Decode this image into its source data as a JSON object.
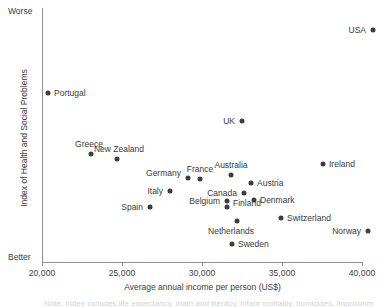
{
  "chart_data": {
    "type": "scatter",
    "title": "",
    "xlabel": "Average annual income per person (US$)",
    "ylabel": "Index of Health and Social Problems",
    "xlim": [
      20000,
      40062
    ],
    "xticks": [
      20000,
      25000,
      30000,
      35000,
      40000
    ],
    "xticklabels": [
      "20,000",
      "25,000",
      "30,000",
      "35,000",
      "40,000"
    ],
    "ylim_labels": {
      "top": "Worse",
      "bottom": "Better"
    },
    "grid": false,
    "legend": "none",
    "point_color": "#3d3d3d",
    "axis_color": "#8f8f8f",
    "points": [
      {
        "name": "USA",
        "x": 40690,
        "y_px": 30,
        "x_px": 373,
        "label_side": "r",
        "label_dx": -7,
        "label_dy": 0
      },
      {
        "name": "Portugal",
        "x": 20375,
        "y_px": 93,
        "x_px": 48,
        "label_side": "l",
        "label_dx": 6,
        "label_dy": 0
      },
      {
        "name": "UK",
        "x": 32500,
        "y_px": 121,
        "x_px": 242,
        "label_side": "r",
        "label_dx": -7,
        "label_dy": 0
      },
      {
        "name": "Greece",
        "x": 23060,
        "y_px": 154,
        "x_px": 91,
        "label_side": "c",
        "label_dx": -2,
        "label_dy": -10
      },
      {
        "name": "New Zealand",
        "x": 24690,
        "y_px": 159,
        "x_px": 117,
        "label_side": "c",
        "label_dx": 2,
        "label_dy": -10
      },
      {
        "name": "Ireland",
        "x": 37560,
        "y_px": 164,
        "x_px": 323,
        "label_side": "l",
        "label_dx": 6,
        "label_dy": 0
      },
      {
        "name": "Australia",
        "x": 31810,
        "y_px": 175,
        "x_px": 231,
        "label_side": "c",
        "label_dx": 0,
        "label_dy": -10
      },
      {
        "name": "France",
        "x": 29875,
        "y_px": 179,
        "x_px": 200,
        "label_side": "c",
        "label_dx": 0,
        "label_dy": -10
      },
      {
        "name": "Germany",
        "x": 29125,
        "y_px": 178,
        "x_px": 188,
        "label_side": "r",
        "label_dx": -7,
        "label_dy": -5
      },
      {
        "name": "Austria",
        "x": 33060,
        "y_px": 183,
        "x_px": 251,
        "label_side": "l",
        "label_dx": 6,
        "label_dy": 0
      },
      {
        "name": "Italy",
        "x": 28000,
        "y_px": 191,
        "x_px": 170,
        "label_side": "r",
        "label_dx": -7,
        "label_dy": 0
      },
      {
        "name": "Canada",
        "x": 32625,
        "y_px": 193,
        "x_px": 244,
        "label_side": "r",
        "label_dx": -7,
        "label_dy": 0
      },
      {
        "name": "Denmark",
        "x": 33250,
        "y_px": 200,
        "x_px": 254,
        "label_side": "l",
        "label_dx": 6,
        "label_dy": 0
      },
      {
        "name": "Belgium",
        "x": 31560,
        "y_px": 201,
        "x_px": 227,
        "label_side": "r",
        "label_dx": -7,
        "label_dy": 0
      },
      {
        "name": "Spain",
        "x": 26750,
        "y_px": 207,
        "x_px": 150,
        "label_side": "r",
        "label_dx": -7,
        "label_dy": 0
      },
      {
        "name": "Finland",
        "x": 31560,
        "y_px": 207,
        "x_px": 227,
        "label_side": "l",
        "label_dx": 6,
        "label_dy": -4
      },
      {
        "name": "Switzerland",
        "x": 35000,
        "y_px": 218,
        "x_px": 281,
        "label_side": "l",
        "label_dx": 6,
        "label_dy": 0
      },
      {
        "name": "Netherlands",
        "x": 32190,
        "y_px": 221,
        "x_px": 237,
        "label_side": "c",
        "label_dx": -6,
        "label_dy": 10
      },
      {
        "name": "Norway",
        "x": 41190,
        "y_px": 231,
        "x_px": 368,
        "label_side": "r",
        "label_dx": -7,
        "label_dy": 0
      },
      {
        "name": "Sweden",
        "x": 31875,
        "y_px": 244,
        "x_px": 232,
        "label_side": "l",
        "label_dx": 6,
        "label_dy": 0
      }
    ]
  },
  "axis": {
    "x_title": "Average annual income per person (US$)",
    "y_title": "Index of Health and Social Problems",
    "worse_label": "Worse",
    "better_label": "Better"
  },
  "caption_cut": "Note: Index includes life expectancy, math and literacy, infant mortality, homicides, imprisonment"
}
